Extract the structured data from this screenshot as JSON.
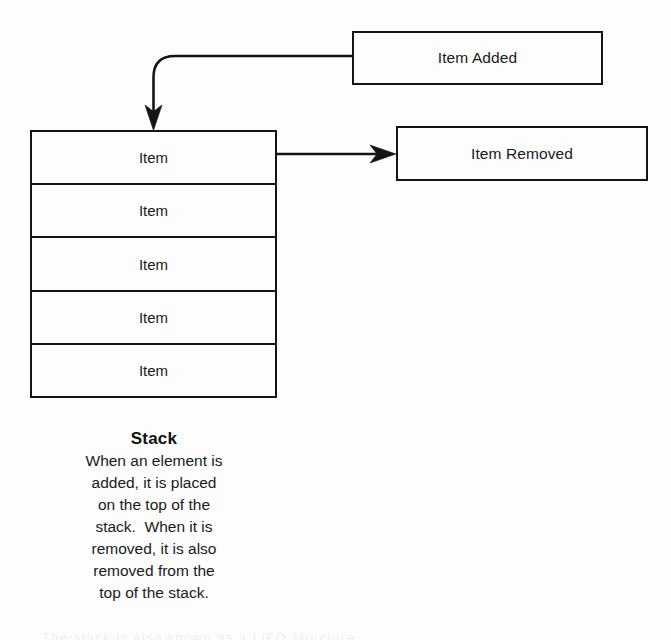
{
  "diagram": {
    "type": "stack-data-structure",
    "background_color": "#fdfdfd",
    "line_color": "#141414",
    "text_color": "#1a1a1a",
    "nodes": {
      "item_added": {
        "label": "Item Added"
      },
      "item_removed": {
        "label": "Item Removed"
      },
      "stack": {
        "cells": [
          {
            "label": "Item"
          },
          {
            "label": "Item"
          },
          {
            "label": "Item"
          },
          {
            "label": "Item"
          },
          {
            "label": "Item"
          }
        ]
      }
    },
    "arrows": {
      "push": {
        "from": "item-added-box",
        "to": "stack-top-cell",
        "style": "elbow-curved-down"
      },
      "pop": {
        "from": "stack-top-cell",
        "to": "item-removed-box",
        "style": "straight-right"
      }
    },
    "caption": {
      "title": "Stack",
      "lines": [
        "When an element is",
        "added, it is placed",
        "on the top of the",
        "stack.  When it is",
        "removed, it is also",
        "removed from the",
        "top of the stack."
      ]
    },
    "bottom_sliver_text": "The stack is also known as a LIFO structure"
  }
}
